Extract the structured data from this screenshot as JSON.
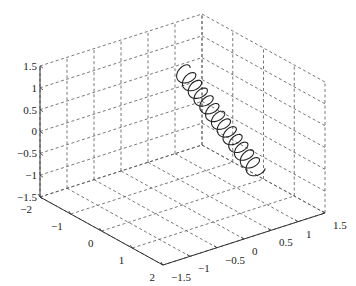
{
  "chart_data": {
    "type": "line",
    "subtype": "3d-line",
    "title": "",
    "xlabel": "",
    "ylabel": "",
    "zlabel": "",
    "xlim": [
      -2,
      2
    ],
    "ylim": [
      -1.5,
      1.5
    ],
    "zlim": [
      -1.5,
      1.5
    ],
    "x_ticks": [
      "-2",
      "-1",
      "0",
      "1",
      "2"
    ],
    "y_ticks": [
      "-1.5",
      "-1",
      "-0.5",
      "0",
      "0.5",
      "1",
      "1.5"
    ],
    "z_ticks": [
      "-1.5",
      "-1",
      "-0.5",
      "0",
      "0.5",
      "1",
      "1.5"
    ],
    "grid": true,
    "grid_style": "dashed",
    "line_color": "#222222",
    "series": [
      {
        "name": "helix",
        "description": "tight helical coil",
        "t_range": [
          0,
          1
        ],
        "start": [
          -1.6,
          0.9,
          0.6
        ],
        "end": [
          1.9,
          0.3,
          -0.1
        ],
        "turns": 13,
        "radius": 0.15
      }
    ]
  }
}
